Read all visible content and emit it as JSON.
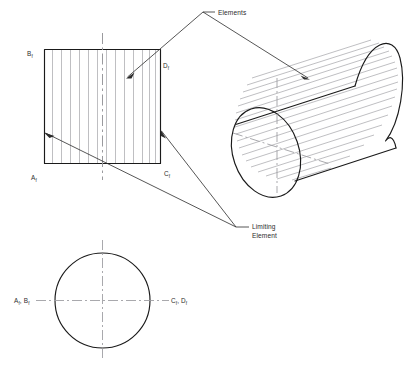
{
  "drawing": {
    "title": "Orthographic and pictorial views of a cylinder",
    "background_color": "#ffffff",
    "object_line_color": "#1a1a1a",
    "element_line_color": "#a9a9ad",
    "center_line_color": "#9a9a9e",
    "leader_color": "#2b2b2b",
    "width": 409,
    "height": 380
  },
  "annotations": {
    "elements": {
      "label": "Elements",
      "x": 218,
      "y": 12
    },
    "limiting_element": {
      "line1": "Limiting",
      "line2": "Element",
      "x": 252,
      "y": 226
    }
  },
  "front_view": {
    "name": "front view rectangle",
    "labels": {
      "top_left": {
        "letter": "B",
        "subscript": "f",
        "x": 27,
        "y": 54
      },
      "bottom_left": {
        "letter": "A",
        "subscript": "f",
        "x": 31,
        "y": 178
      },
      "top_right": {
        "letter": "D",
        "subscript": "f",
        "x": 163,
        "y": 66
      },
      "bottom_right": {
        "letter": "C",
        "subscript": "f",
        "x": 164,
        "y": 174
      }
    },
    "element_count": 13
  },
  "top_view": {
    "name": "top view circle",
    "labels": {
      "left": {
        "text": "A",
        "sub1": "f",
        "text2": ", B",
        "sub2": "f",
        "x": 14,
        "y": 301
      },
      "right": {
        "text": "C",
        "sub1": "f",
        "text2": ", D",
        "sub2": "f",
        "x": 168,
        "y": 301
      }
    }
  },
  "pictorial_view": {
    "name": "isometric cylinder",
    "element_count": 18
  }
}
